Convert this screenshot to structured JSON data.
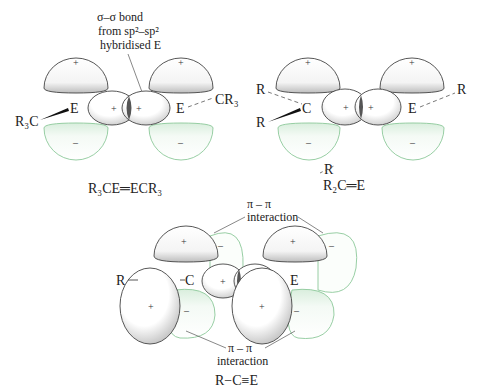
{
  "panels": {
    "top_left": {
      "annotation": [
        "σ–σ bond",
        "from sp²–sp²",
        "hybridised E"
      ],
      "atom_left": "E",
      "atom_right": "E",
      "sub_left": "R₃C",
      "sub_right": "CR₃",
      "formula": "R₃CE═ECR₃",
      "signs": {
        "upper": "+",
        "lower": "−",
        "sigma": "+"
      }
    },
    "top_right": {
      "atom_left": "C",
      "atom_right": "E",
      "sub_left_top": "R",
      "sub_left_bottom": "R",
      "sub_right": "R",
      "formula": "R₂C═E",
      "formula_sub": "R"
    },
    "bottom": {
      "annotation_top": [
        "π – π",
        "interaction"
      ],
      "annotation_bottom": [
        "π – π",
        "interaction"
      ],
      "atom_left": "C",
      "atom_right": "E",
      "sub_left": "R",
      "formula": "R−C≡E"
    }
  },
  "colors": {
    "positive_lobe_fill": "#ffffff",
    "positive_lobe_shade": "#c8c8c8",
    "negative_lobe_stroke": "#8cc89a",
    "negative_lobe_fill": "#e9f5ec",
    "outline": "#444444"
  }
}
